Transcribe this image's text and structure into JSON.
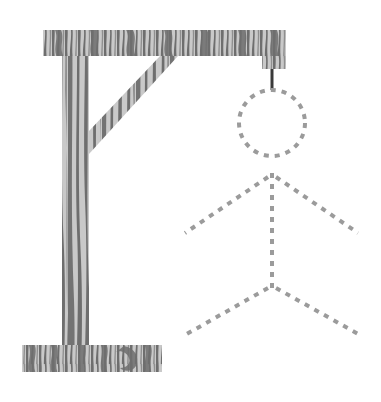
{
  "illustration": {
    "title": "Hangman",
    "subject": "hangman-gallows-with-stick-figure",
    "canvas": {
      "width": 381,
      "height": 402,
      "background": "#ffffff"
    },
    "palette": {
      "wood_light": "#c9c9c9",
      "wood_dark": "#6e6e6e",
      "wood_mid": "#8f8f8f",
      "rope": "#3a3a3a",
      "figure_dash": "#9b9b9b",
      "background": "#ffffff"
    }
  },
  "gallows": {
    "label": "Gallows",
    "top_beam": {
      "label": "Top beam",
      "x": 43,
      "y": 30,
      "width": 243,
      "height": 26
    },
    "beam_end_block": {
      "label": "Beam end block",
      "x": 262,
      "y": 56,
      "width": 24,
      "height": 13
    },
    "post": {
      "label": "Vertical post",
      "x": 62,
      "y": 30,
      "width": 27,
      "height": 330
    },
    "base": {
      "label": "Base plank",
      "x": 22,
      "y": 345,
      "width": 140,
      "height": 27
    },
    "brace": {
      "label": "Diagonal brace",
      "from_x": 89,
      "from_y": 131,
      "to_x": 160,
      "to_y": 56,
      "thickness": 22
    }
  },
  "rope": {
    "label": "Rope",
    "x": 272,
    "top_y": 69,
    "bottom_y": 90,
    "width": 3,
    "color": "#3a3a3a"
  },
  "figure": {
    "label": "Stick figure outline",
    "style": "dashed",
    "dash_color": "#9b9b9b",
    "dash_width": 4,
    "dash_pattern": "5 6",
    "head": {
      "label": "Head",
      "cx": 272,
      "cy": 123,
      "r": 33
    },
    "torso": {
      "label": "Torso",
      "x1": 272,
      "y1": 173,
      "x2": 272,
      "y2": 292
    },
    "left_arm": {
      "label": "Left arm",
      "x1": 268,
      "y1": 177,
      "x2": 185,
      "y2": 233
    },
    "right_arm": {
      "label": "Right arm",
      "x1": 276,
      "y1": 177,
      "x2": 358,
      "y2": 233
    },
    "left_leg": {
      "label": "Left leg",
      "x1": 268,
      "y1": 288,
      "x2": 185,
      "y2": 335
    },
    "right_leg": {
      "label": "Right leg",
      "x1": 276,
      "y1": 288,
      "x2": 360,
      "y2": 335
    }
  },
  "accessibility": {
    "alt_text": "Hangman drawing: a wooden gallows on the left with a top beam, diagonal brace and base, and a short rope hanging from the beam end. To the right a stick figure is drawn entirely with gray dashed lines: a dashed circular head, a dashed vertical torso, two dashed arms angling down and out, and two dashed legs angling down and out."
  }
}
